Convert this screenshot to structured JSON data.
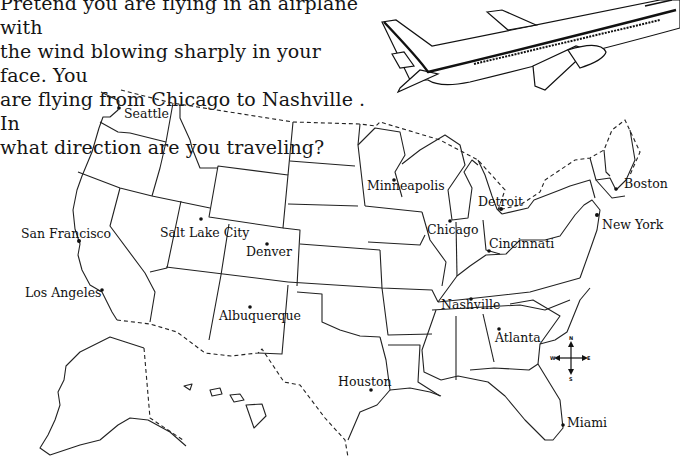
{
  "question": {
    "lines": [
      "Pretend you are flying in an airplane with",
      "the wind blowing sharply in your face. You",
      "are flying from Chicago to  Nashville . In",
      "what direction are you traveling?"
    ],
    "origin": "Chicago",
    "destination": "Nashville"
  },
  "illustration": {
    "subject": "airplane-icon"
  },
  "map": {
    "title": "United States map",
    "cities": [
      {
        "name": "Seattle",
        "x": 119,
        "y": 108
      },
      {
        "name": "San Francisco",
        "x": 80,
        "y": 242
      },
      {
        "name": "Salt Lake City",
        "x": 201,
        "y": 219
      },
      {
        "name": "Denver",
        "x": 267,
        "y": 244
      },
      {
        "name": "Los Angeles",
        "x": 102,
        "y": 290
      },
      {
        "name": "Albuquerque",
        "x": 250,
        "y": 307
      },
      {
        "name": "Minneapolis",
        "x": 394,
        "y": 180
      },
      {
        "name": "Chicago",
        "x": 450,
        "y": 221
      },
      {
        "name": "Detroit",
        "x": 501,
        "y": 209
      },
      {
        "name": "Cincinnati",
        "x": 489,
        "y": 244
      },
      {
        "name": "Boston",
        "x": 616,
        "y": 189
      },
      {
        "name": "New York",
        "x": 597,
        "y": 215
      },
      {
        "name": "Nashville",
        "x": 471,
        "y": 299
      },
      {
        "name": "Atlanta",
        "x": 498,
        "y": 329
      },
      {
        "name": "Houston",
        "x": 371,
        "y": 390
      },
      {
        "name": "Miami",
        "x": 563,
        "y": 425
      }
    ],
    "compass": {
      "n": "N",
      "s": "S",
      "e": "E",
      "w": "W"
    }
  }
}
